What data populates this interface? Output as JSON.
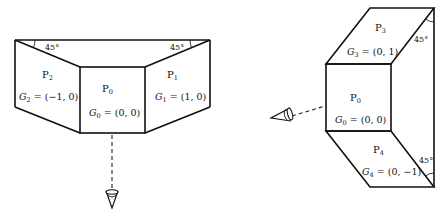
{
  "figure": {
    "left_diagram": {
      "description": "Top-down view into a truncated pyramid: central face P0 with sloped side faces P1 and P2, viewed from below",
      "faces": [
        {
          "id": "P2",
          "base": "P",
          "sub": "2",
          "g_label": "G",
          "g_sub": "2",
          "g_value": " = (−1, 0)"
        },
        {
          "id": "P0",
          "base": "P",
          "sub": "0",
          "g_label": "G",
          "g_sub": "0",
          "g_value": " = (0, 0)"
        },
        {
          "id": "P1",
          "base": "P",
          "sub": "1",
          "g_label": "G",
          "g_sub": "1",
          "g_value": " = (1, 0)"
        }
      ],
      "angles": [
        "45°",
        "45°"
      ],
      "viewer": "eye-icon-below"
    },
    "right_diagram": {
      "description": "Side view: central face P0 with faces P3 above and P4 below slanted at 45°, viewed from the left",
      "faces": [
        {
          "id": "P3",
          "base": "P",
          "sub": "3",
          "g_label": "G",
          "g_sub": "3",
          "g_value": " = (0, 1)"
        },
        {
          "id": "P0",
          "base": "P",
          "sub": "0",
          "g_label": "G",
          "g_sub": "0",
          "g_value": " = (0, 0)"
        },
        {
          "id": "P4",
          "base": "P",
          "sub": "4",
          "g_label": "G",
          "g_sub": "4",
          "g_value": " = (0, −1)"
        }
      ],
      "angles": [
        "45°",
        "45°"
      ],
      "viewer": "eye-icon-left"
    }
  }
}
